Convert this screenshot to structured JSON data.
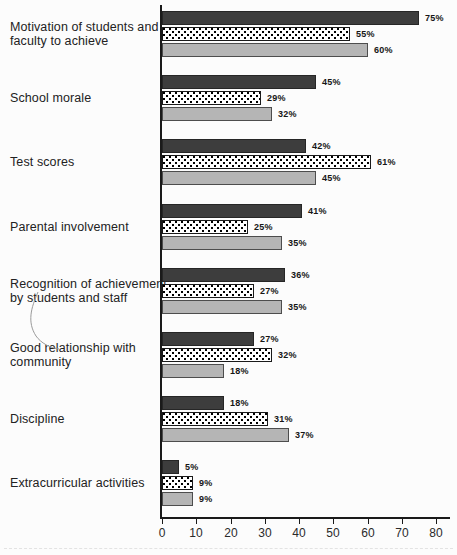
{
  "chart_data": {
    "type": "bar",
    "orientation": "horizontal",
    "title": "",
    "xlabel": "",
    "ylabel": "",
    "xlim": [
      0,
      80
    ],
    "x_ticks": [
      0,
      10,
      20,
      30,
      40,
      50,
      60,
      70,
      80
    ],
    "grid": false,
    "legend": "none",
    "value_suffix": "%",
    "categories": [
      "Motivation of students and faculty to achieve",
      "School morale",
      "Test scores",
      "Parental involvement",
      "Recognition of achievement by students and staff",
      "Good relationship with community",
      "Discipline",
      "Extracurricular activities"
    ],
    "series": [
      {
        "name": "dark-solid-bar",
        "style": "dark",
        "values": [
          75,
          45,
          42,
          41,
          36,
          27,
          18,
          5
        ]
      },
      {
        "name": "dotted-pattern-bar",
        "style": "dotted",
        "values": [
          55,
          29,
          61,
          25,
          27,
          32,
          31,
          9
        ]
      },
      {
        "name": "light-gray-bar",
        "style": "gray",
        "values": [
          60,
          32,
          45,
          35,
          35,
          18,
          37,
          9
        ]
      }
    ],
    "colors": {
      "dark_bar": "#3d3d3d",
      "dotted_bar_background": "#ffffff",
      "dotted_bar_dot": "#000000",
      "gray_bar": "#b5b5b5",
      "axis": "#1a1a1a"
    }
  }
}
